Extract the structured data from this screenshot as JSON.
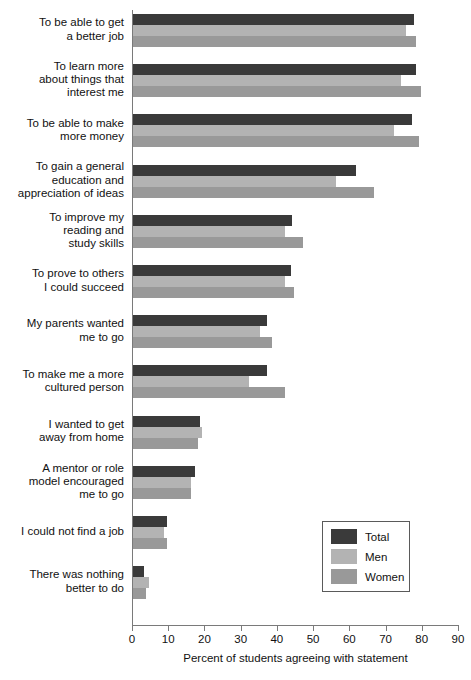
{
  "chart_data": {
    "type": "bar",
    "orientation": "horizontal",
    "title": "",
    "xlabel": "Percent of students agreeing with statement",
    "ylabel": "",
    "xlim": [
      0,
      90
    ],
    "xticks": [
      0,
      10,
      20,
      30,
      40,
      50,
      60,
      70,
      80,
      90
    ],
    "grid": false,
    "legend_position": "center-right",
    "categories": [
      "To be able to get a better job",
      "To learn more about things that interest me",
      "To be able to make more money",
      "To gain a general education and appreciation of ideas",
      "To improve my reading and study skills",
      "To prove to others I could succeed",
      "My parents wanted me to go",
      "To make me a more cultured person",
      "I wanted to get away from home",
      "A mentor or role model encouraged me to go",
      "I could not find a job",
      "There was nothing better to do"
    ],
    "category_lines": [
      [
        "To be able to get",
        "a better job"
      ],
      [
        "To learn more",
        "about things that",
        "interest me"
      ],
      [
        "To be able to make",
        "more money"
      ],
      [
        "To gain a general",
        "education and",
        "appreciation of ideas"
      ],
      [
        "To improve my",
        "reading and",
        "study skills"
      ],
      [
        "To prove to others",
        "I could succeed"
      ],
      [
        "My parents wanted",
        "me to go"
      ],
      [
        "To make me a more",
        "cultured person"
      ],
      [
        "I wanted to get",
        "away from home"
      ],
      [
        "A mentor or role",
        "model encouraged",
        "me to go"
      ],
      [
        "I could not find a job"
      ],
      [
        "There was nothing",
        "better to do"
      ]
    ],
    "series": [
      {
        "name": "Total",
        "color": "#3a3a3a",
        "values": [
          77.5,
          78,
          77,
          61.5,
          44,
          43.5,
          37,
          37,
          18.5,
          17,
          9.5,
          3
        ]
      },
      {
        "name": "Men",
        "color": "#b3b3b3",
        "values": [
          75.5,
          74,
          72,
          56,
          42,
          42,
          35,
          32,
          19,
          16,
          8.5,
          4.5
        ]
      },
      {
        "name": "Women",
        "color": "#999999",
        "values": [
          78,
          79.5,
          79,
          66.5,
          47,
          44.5,
          38.5,
          42,
          18,
          16,
          9.5,
          3.5
        ]
      }
    ]
  },
  "legend": {
    "items": [
      {
        "label": "Total",
        "key": "total"
      },
      {
        "label": "Men",
        "key": "men"
      },
      {
        "label": "Women",
        "key": "women"
      }
    ]
  }
}
